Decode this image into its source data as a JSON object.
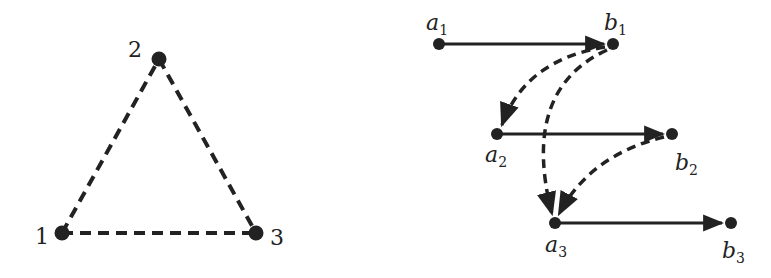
{
  "colors": {
    "stroke": "#222222",
    "background": "#ffffff"
  },
  "left_graph": {
    "nodes": [
      {
        "id": "1",
        "label": "1",
        "x": 62,
        "y": 233
      },
      {
        "id": "2",
        "label": "2",
        "x": 159,
        "y": 59
      },
      {
        "id": "3",
        "label": "3",
        "x": 256,
        "y": 233
      }
    ],
    "edges": [
      {
        "from": "1",
        "to": "2",
        "style": "dashed"
      },
      {
        "from": "2",
        "to": "3",
        "style": "dashed"
      },
      {
        "from": "1",
        "to": "3",
        "style": "dashed"
      }
    ]
  },
  "right_graph": {
    "nodes": [
      {
        "id": "a1",
        "base": "a",
        "sub": "1",
        "x": 439,
        "y": 44
      },
      {
        "id": "b1",
        "base": "b",
        "sub": "1",
        "x": 613,
        "y": 44
      },
      {
        "id": "a2",
        "base": "a",
        "sub": "2",
        "x": 497,
        "y": 134
      },
      {
        "id": "b2",
        "base": "b",
        "sub": "2",
        "x": 672,
        "y": 134
      },
      {
        "id": "a3",
        "base": "a",
        "sub": "3",
        "x": 555,
        "y": 223
      },
      {
        "id": "b3",
        "base": "b",
        "sub": "3",
        "x": 731,
        "y": 223
      }
    ],
    "edges": [
      {
        "from": "a1",
        "to": "b1",
        "style": "solid-arrow"
      },
      {
        "from": "a2",
        "to": "b2",
        "style": "solid-arrow"
      },
      {
        "from": "a3",
        "to": "b3",
        "style": "solid-arrow"
      },
      {
        "from": "b1",
        "to": "a2",
        "style": "dashed-curved-arrow"
      },
      {
        "from": "b1",
        "to": "a3",
        "style": "dashed-curved-arrow"
      },
      {
        "from": "b2",
        "to": "a3",
        "style": "dashed-curved-arrow"
      }
    ]
  }
}
